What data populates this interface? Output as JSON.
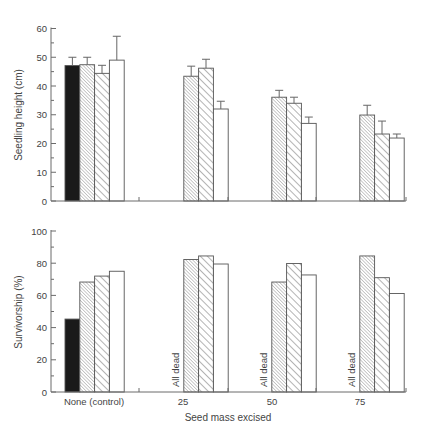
{
  "chart_data": [
    {
      "type": "bar",
      "title": "",
      "xlabel": "",
      "ylabel": "Seedling height (cm)",
      "ylim": [
        0,
        60
      ],
      "yticks": [
        0,
        10,
        20,
        30,
        40,
        50,
        60
      ],
      "grid": false,
      "legend": null,
      "categories": [
        "None (control)",
        "25",
        "50",
        "75"
      ],
      "series": [
        {
          "name": "solid black",
          "fill": "solid",
          "values": [
            47.1,
            null,
            null,
            null
          ],
          "error_upper": [
            50.0,
            null,
            null,
            null
          ]
        },
        {
          "name": "fine hatch",
          "fill": "fine-hatch",
          "values": [
            47.4,
            43.4,
            36.1,
            29.9
          ],
          "error_upper": [
            50.0,
            46.9,
            38.5,
            33.3
          ]
        },
        {
          "name": "coarse hatch",
          "fill": "coarse-hatch",
          "values": [
            44.4,
            46.2,
            34.0,
            23.3
          ],
          "error_upper": [
            47.2,
            49.3,
            36.1,
            27.8
          ]
        },
        {
          "name": "open",
          "fill": "white",
          "values": [
            49.0,
            32.0,
            27.0,
            21.9
          ],
          "error_upper": [
            57.3,
            34.7,
            29.2,
            23.3
          ]
        }
      ]
    },
    {
      "type": "bar",
      "title": "",
      "xlabel": "Seed mass excised",
      "ylabel": "Survivorship (%)",
      "ylim": [
        0,
        100
      ],
      "yticks": [
        0,
        20,
        40,
        60,
        80,
        100
      ],
      "grid": false,
      "legend": null,
      "categories": [
        "None (control)",
        "25",
        "50",
        "75"
      ],
      "series": [
        {
          "name": "solid black",
          "fill": "solid",
          "values": [
            45.3,
            null,
            null,
            null
          ]
        },
        {
          "name": "fine hatch",
          "fill": "fine-hatch",
          "values": [
            68.3,
            82.3,
            68.3,
            84.5
          ]
        },
        {
          "name": "coarse hatch",
          "fill": "coarse-hatch",
          "values": [
            72.0,
            84.5,
            79.8,
            71.0
          ]
        },
        {
          "name": "open",
          "fill": "white",
          "values": [
            75.0,
            79.5,
            72.7,
            61.2
          ]
        }
      ],
      "annotations": [
        {
          "category": "25",
          "text": "All dead"
        },
        {
          "category": "50",
          "text": "All dead"
        },
        {
          "category": "75",
          "text": "All dead"
        }
      ]
    }
  ],
  "labels": {
    "top_ylabel": "Seedling height (cm)",
    "bottom_ylabel": "Survivorship (%)",
    "xlabel": "Seed mass excised",
    "dead_text": "All dead"
  },
  "colors": {
    "solid": "#1a1a1a",
    "hatch": "#777777",
    "axis": "#6b6b6b",
    "open": "#ffffff"
  }
}
